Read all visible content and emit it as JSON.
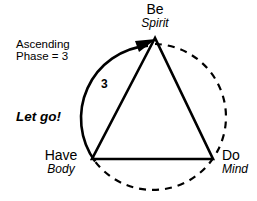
{
  "diagram": {
    "vertices": [
      {
        "id": "be",
        "title": "Be",
        "subtitle": "Spirit"
      },
      {
        "id": "have",
        "title": "Have",
        "subtitle": "Body"
      },
      {
        "id": "do",
        "title": "Do",
        "subtitle": "Mind"
      }
    ],
    "annotations": {
      "ascending_line1": "Ascending",
      "ascending_line2": "Phase = 3",
      "emphasis": "Let go!",
      "phase_number": "3"
    },
    "colors": {
      "stroke": "#000000",
      "background": "#ffffff"
    }
  }
}
